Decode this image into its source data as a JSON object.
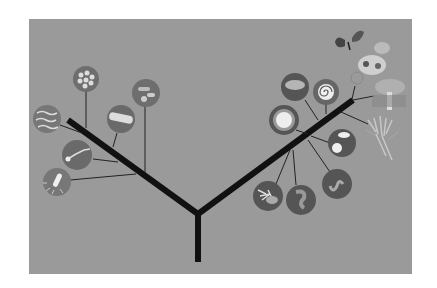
{
  "diagram": {
    "title": "",
    "type": "phylogenetic-tree",
    "colors": {
      "background": "#ffffff",
      "panel": "#9a9a9a",
      "branch": "#111111",
      "leaf_line": "#222222",
      "circle_fill": "#6e6e6e",
      "circle_edge": "#555555"
    },
    "left_clade": {
      "name": "bacteria",
      "leaves": [
        {
          "icon": "cocci-cluster-icon"
        },
        {
          "icon": "rod-chain-icon"
        },
        {
          "icon": "capsule-rod-icon"
        },
        {
          "icon": "spirilla-icon"
        },
        {
          "icon": "flagellated-bacterium-icon"
        },
        {
          "icon": "flagellated-rod-icon"
        }
      ]
    },
    "right_clade": {
      "name": "eukaryotes",
      "leaves": [
        {
          "icon": "amoeba-icon"
        },
        {
          "icon": "foraminifera-shell-icon"
        },
        {
          "icon": "radiolarian-icon"
        },
        {
          "icon": "diatom-icon"
        },
        {
          "icon": "worm-like-protist-icon"
        },
        {
          "icon": "coral-like-protist-icon"
        },
        {
          "icon": "curled-protist-icon"
        },
        {
          "icon": "butterfly-icon"
        },
        {
          "icon": "animals-cluster-icon"
        },
        {
          "icon": "mushroom-icon"
        },
        {
          "icon": "plant-roots-icon"
        }
      ]
    }
  }
}
